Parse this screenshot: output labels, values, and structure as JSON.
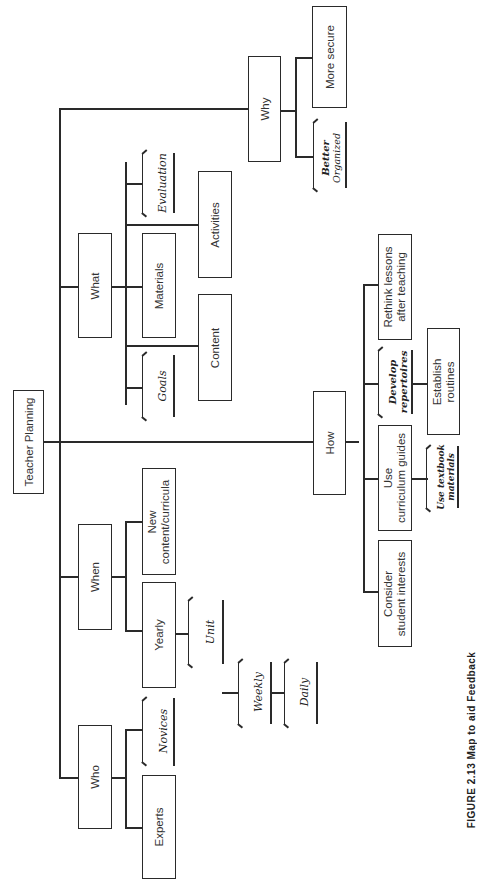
{
  "diagram": {
    "root": "Teacher Planning",
    "branches": {
      "why": {
        "label": "Why",
        "children": [
          "More secure"
        ],
        "handwritten": [
          "Better Organized"
        ]
      },
      "what": {
        "label": "What",
        "children": [
          "Materials",
          "Activities",
          "Content"
        ],
        "handwritten": [
          "Evaluation",
          "Goals"
        ]
      },
      "how": {
        "label": "How",
        "children": [
          "Rethink lessons after teaching",
          "Establish routines",
          "Use curriculum guides",
          "Consider student interests"
        ],
        "handwritten": [
          "Develop repertoires",
          "Use textbook materials"
        ]
      },
      "when": {
        "label": "When",
        "children": [
          "New content/curricula",
          "Yearly"
        ],
        "handwritten": [
          "Unit",
          "Weekly",
          "Daily"
        ]
      },
      "who": {
        "label": "Who",
        "children": [
          "Experts"
        ],
        "handwritten": [
          "Novices"
        ]
      }
    },
    "labels": {
      "root": "Teacher Planning",
      "why": "Why",
      "more_secure": "More secure",
      "better": "Better",
      "organized": "Organized",
      "what": "What",
      "materials": "Materials",
      "activities": "Activities",
      "content": "Content",
      "evaluation": "Evaluation",
      "goals": "Goals",
      "how": "How",
      "rethink_1": "Rethink lessons",
      "rethink_2": "after teaching",
      "develop": "Develop",
      "repertoires": "repertoires",
      "establish_1": "Establish",
      "establish_2": "routines",
      "use_1": "Use",
      "use_2": "curriculum guides",
      "textbook_1": "Use textbook",
      "textbook_2": "materials",
      "consider_1": "Consider",
      "consider_2": "student interests",
      "when": "When",
      "new_1": "New",
      "new_2": "content/curricula",
      "yearly": "Yearly",
      "unit": "Unit",
      "weekly": "Weekly",
      "daily": "Daily",
      "who": "Who",
      "experts": "Experts",
      "novices": "Novices"
    },
    "caption": "FIGURE 2.13  Map to aid Feedback"
  }
}
